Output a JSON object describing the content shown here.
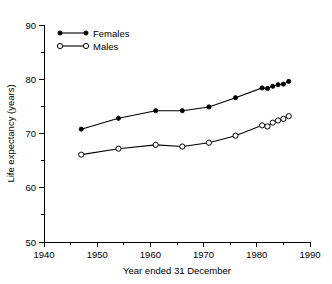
{
  "chart_data": {
    "type": "line",
    "title": "",
    "xlabel": "Year ended 31 December",
    "ylabel": "Life expectancy (years)",
    "xlim": [
      1940,
      1990
    ],
    "ylim": [
      50,
      90
    ],
    "x_major_ticks": [
      1940,
      1950,
      1960,
      1970,
      1980,
      1990
    ],
    "x_minor_ticks": [
      1945,
      1955,
      1965,
      1975,
      1985
    ],
    "y_major_ticks": [
      50,
      60,
      70,
      80,
      90
    ],
    "y_minor_ticks": [
      55,
      65,
      75,
      85
    ],
    "x_tick_labels": [
      "1940",
      "1950",
      "1960",
      "1970",
      "1980",
      "1990"
    ],
    "y_tick_labels": [
      "50",
      "60",
      "70",
      "80",
      "90"
    ],
    "grid": false,
    "legend_position": "top-left-inside",
    "series": [
      {
        "name": "Females",
        "marker": "filled-circle",
        "color": "#000000",
        "x": [
          1947,
          1954,
          1961,
          1966,
          1971,
          1976,
          1981,
          1982,
          1983,
          1984,
          1985,
          1986
        ],
        "values": [
          70.8,
          72.8,
          74.2,
          74.2,
          74.9,
          76.6,
          78.4,
          78.3,
          78.7,
          79.0,
          79.1,
          79.6
        ]
      },
      {
        "name": "Males",
        "marker": "open-circle",
        "color": "#000000",
        "x": [
          1947,
          1954,
          1961,
          1966,
          1971,
          1976,
          1981,
          1982,
          1983,
          1984,
          1985,
          1986
        ],
        "values": [
          66.1,
          67.2,
          67.9,
          67.6,
          68.3,
          69.6,
          71.5,
          71.3,
          72.0,
          72.4,
          72.7,
          73.2
        ]
      }
    ]
  },
  "legend": {
    "entries": [
      {
        "label": "Females"
      },
      {
        "label": "Males"
      }
    ]
  },
  "axes": {
    "x_title": "Year ended 31 December",
    "y_title": "Life expectancy (years)"
  }
}
